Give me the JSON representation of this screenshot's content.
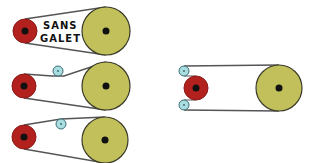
{
  "diagram": {
    "title_line1": "SANS",
    "title_line2": "GALET",
    "colors": {
      "drive_pulley": "#b3211e",
      "drive_pulley_ring": "#8a1a16",
      "driven_pulley": "#c2c05a",
      "driven_pulley_ring": "#3a3a2a",
      "idler": "#a9dde0",
      "idler_ring": "#3c6f78",
      "hub": "#111111",
      "belt": "#555555"
    },
    "configurations": [
      {
        "name": "no-idler",
        "label": "SANS GALET"
      },
      {
        "name": "idler-top-near-drive"
      },
      {
        "name": "idler-top-mid"
      },
      {
        "name": "two-idlers-outside-drive"
      }
    ]
  }
}
